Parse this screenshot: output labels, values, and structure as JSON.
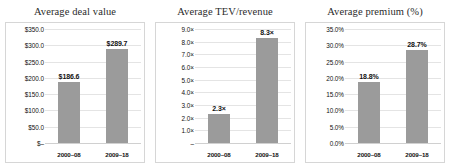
{
  "figure": {
    "panel_count": 3,
    "bar_color": "#9b9b9b",
    "grid_color": "#e4e4e4",
    "border_color": "#d6d6d6",
    "text_color": "#111111"
  },
  "chart_data": [
    {
      "type": "bar",
      "title": "Average deal value",
      "xlabel": "",
      "ylabel": "",
      "categories": [
        "2000–08",
        "2009–18"
      ],
      "values": [
        186.6,
        289.7
      ],
      "data_labels": [
        "$186.6",
        "$289.7"
      ],
      "ylim": [
        0,
        350
      ],
      "yticks": [
        0,
        50,
        100,
        150,
        200,
        250,
        300,
        350
      ],
      "ytick_labels": [
        "$–",
        "$50.0",
        "$100.0",
        "$150.0",
        "$200.0",
        "$250.0",
        "$300.0",
        "$350.0"
      ],
      "grid": true,
      "legend": "none"
    },
    {
      "type": "bar",
      "title": "Average TEV/revenue",
      "xlabel": "",
      "ylabel": "",
      "categories": [
        "2000–08",
        "2009–18"
      ],
      "values": [
        2.3,
        8.3
      ],
      "data_labels": [
        "2.3×",
        "8.3×"
      ],
      "ylim": [
        0,
        9
      ],
      "yticks": [
        0,
        1,
        2,
        3,
        4,
        5,
        6,
        7,
        8,
        9
      ],
      "ytick_labels": [
        "–",
        "1.0×",
        "2.0×",
        "3.0×",
        "4.0×",
        "5.0×",
        "6.0×",
        "7.0×",
        "8.0×",
        "9.0×"
      ],
      "grid": true,
      "legend": "none"
    },
    {
      "type": "bar",
      "title": "Average premium (%)",
      "xlabel": "",
      "ylabel": "",
      "categories": [
        "2000–08",
        "2009–18"
      ],
      "values": [
        18.8,
        28.7
      ],
      "data_labels": [
        "18.8%",
        "28.7%"
      ],
      "ylim": [
        0,
        35
      ],
      "yticks": [
        0,
        5,
        10,
        15,
        20,
        25,
        30,
        35
      ],
      "ytick_labels": [
        "0.0%",
        "5.0%",
        "10.0%",
        "15.0%",
        "20.0%",
        "25.0%",
        "30.0%",
        "35.0%"
      ],
      "grid": true,
      "legend": "none"
    }
  ]
}
